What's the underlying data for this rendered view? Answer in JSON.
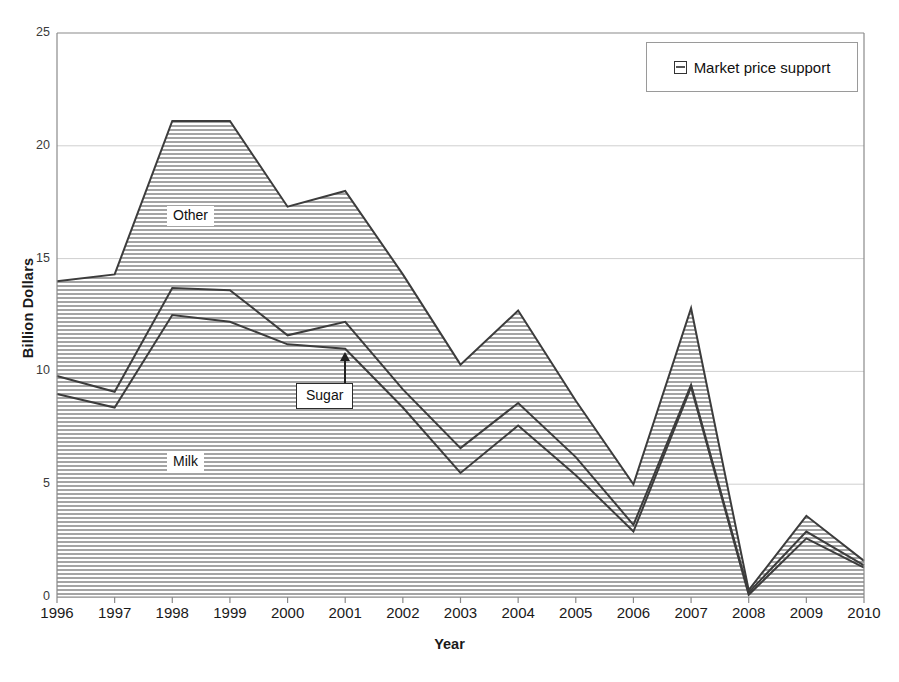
{
  "chart_data": {
    "type": "area",
    "stacked": true,
    "title": "",
    "xlabel": "Year",
    "ylabel": "Billion Dollars",
    "categories": [
      1996,
      1997,
      1998,
      1999,
      2000,
      2001,
      2002,
      2003,
      2004,
      2005,
      2006,
      2007,
      2008,
      2009,
      2010
    ],
    "xtick_labels": [
      "1996",
      "1997",
      "1998",
      "1999",
      "2000",
      "2001",
      "2002",
      "2003",
      "2004",
      "2005",
      "2006",
      "2007",
      "2008",
      "2009",
      "2010"
    ],
    "ytick_labels": [
      "0",
      "5",
      "10",
      "15",
      "20",
      "25"
    ],
    "yticks": [
      0,
      5,
      10,
      15,
      20,
      25
    ],
    "ylim": [
      0,
      25
    ],
    "xlim": [
      1996,
      2010
    ],
    "grid": "horizontal",
    "legend_position": "top-right",
    "legend_entries": [
      "Market price support"
    ],
    "annotations": [
      {
        "text": "Other",
        "series": "Other",
        "kind": "inline-label"
      },
      {
        "text": "Sugar",
        "series": "Sugar",
        "kind": "callout-box-with-arrow"
      },
      {
        "text": "Milk",
        "series": "Milk",
        "kind": "inline-label"
      }
    ],
    "series": [
      {
        "name": "Milk",
        "values": [
          9.0,
          8.4,
          12.5,
          12.2,
          11.2,
          11.0,
          8.4,
          5.5,
          7.6,
          5.4,
          2.9,
          9.3,
          0.1,
          2.6,
          1.3
        ]
      },
      {
        "name": "Sugar",
        "values": [
          0.8,
          0.7,
          1.2,
          1.4,
          0.4,
          1.2,
          0.8,
          1.1,
          1.0,
          0.8,
          0.3,
          0.1,
          0.1,
          0.3,
          0.1
        ]
      },
      {
        "name": "Other",
        "values": [
          4.2,
          5.2,
          7.4,
          7.5,
          5.7,
          5.8,
          5.1,
          3.7,
          4.1,
          2.5,
          1.8,
          3.4,
          0.1,
          0.7,
          0.2
        ]
      }
    ],
    "cumulative": {
      "Milk": [
        9.0,
        8.4,
        12.5,
        12.2,
        11.2,
        11.0,
        8.4,
        5.5,
        7.6,
        5.4,
        2.9,
        9.3,
        0.1,
        2.6,
        1.3
      ],
      "Milk+Sugar": [
        9.8,
        9.1,
        13.7,
        13.6,
        11.6,
        12.2,
        9.2,
        6.6,
        8.6,
        6.2,
        3.2,
        9.4,
        0.2,
        2.9,
        1.4
      ],
      "Milk+Sugar+Other": [
        14.0,
        14.3,
        21.1,
        21.1,
        17.3,
        18.0,
        14.3,
        10.3,
        12.7,
        8.7,
        5.0,
        12.8,
        0.3,
        3.6,
        1.6
      ]
    }
  },
  "legend": {
    "label": "Market price support"
  },
  "axes": {
    "ylabel": "Billion Dollars",
    "xlabel": "Year"
  },
  "notes": {
    "other": "Other",
    "sugar": "Sugar",
    "milk": "Milk"
  }
}
